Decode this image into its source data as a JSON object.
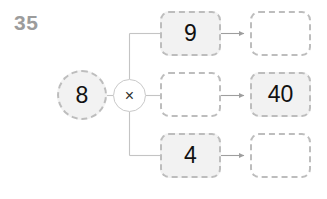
{
  "problem": {
    "number_label": "35",
    "type": "multiplication-function-machine",
    "operator_symbol": "×",
    "operator_name": "multiply-icon",
    "input_value": "8"
  },
  "colors": {
    "filled_node_fill": "#f2f2f2",
    "empty_node_fill": "#ffffff",
    "node_border": "#bdbdbd",
    "operator_border": "#c9c9c9",
    "wire": "#c4c4c4",
    "arrow": "#9e9e9e",
    "text": "#111111",
    "number_label_text": "#9c9c9c"
  },
  "rows": [
    {
      "id": "row-top",
      "factor": {
        "value": "9",
        "filled": true,
        "empty": false
      },
      "product": {
        "value": "",
        "filled": false,
        "empty": true
      }
    },
    {
      "id": "row-middle",
      "factor": {
        "value": "",
        "filled": false,
        "empty": true
      },
      "product": {
        "value": "40",
        "filled": true,
        "empty": false
      }
    },
    {
      "id": "row-bottom",
      "factor": {
        "value": "4",
        "filled": true,
        "empty": false
      },
      "product": {
        "value": "",
        "filled": false,
        "empty": true
      }
    }
  ]
}
